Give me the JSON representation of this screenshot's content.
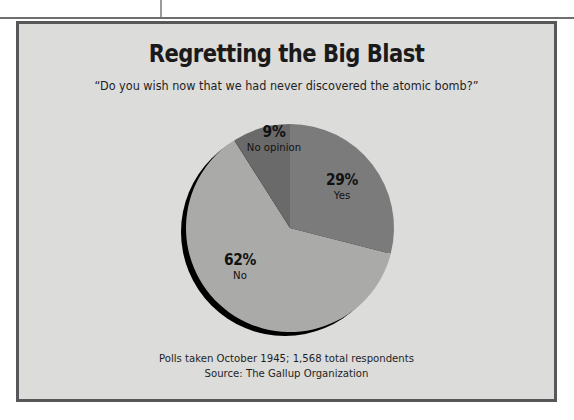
{
  "figure": {
    "title": "Regretting the Big Blast",
    "subtitle": "“Do you wish now that we had never discovered the atomic bomb?”",
    "footnote_line1": "Polls taken October 1945; 1,568 total respondents",
    "footnote_line2": "Source: The Gallup Organization",
    "background_color": "#dcdcda",
    "border_color": "#57575a"
  },
  "chart_data": {
    "type": "pie",
    "title": "Regretting the Big Blast",
    "subtitle": "“Do you wish now that we had never discovered the atomic bomb?”",
    "categories": [
      "Yes",
      "No",
      "No opinion"
    ],
    "values": [
      29,
      62,
      9
    ],
    "value_labels": [
      "29%",
      "62%",
      "9%"
    ],
    "unit": "percent",
    "colors": [
      "#7b7b7b",
      "#aaaaa8",
      "#6a6a6a"
    ],
    "start_angle_deg": 0,
    "direction": "clockwise",
    "legend": "none",
    "labels_inside": true,
    "shadow": "#000000",
    "slices": [
      {
        "label": "Yes",
        "percent": 29,
        "percent_text": "29%",
        "color": "#7b7b7b"
      },
      {
        "label": "No",
        "percent": 62,
        "percent_text": "62%",
        "color": "#aaaaa8"
      },
      {
        "label": "No opinion",
        "percent": 9,
        "percent_text": "9%",
        "color": "#6a6a6a"
      }
    ],
    "xlabel": "",
    "ylabel": "",
    "annotations": [
      "Polls taken October 1945; 1,568 total respondents",
      "Source: The Gallup Organization"
    ]
  }
}
